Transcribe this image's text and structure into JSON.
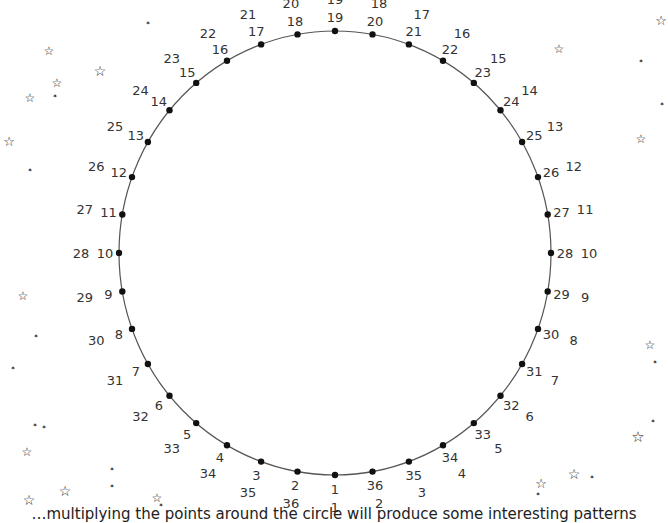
{
  "diagram": {
    "type": "modular-circle",
    "point_count": 36,
    "center": [
      335,
      253
    ],
    "radius_x": 216,
    "radius_y": 222,
    "start_point_position": "bottom",
    "direction": "clockwise-from-bottom",
    "line_color": "#555555",
    "dot_color": "#111111",
    "inner_labels": [
      1,
      2,
      3,
      4,
      5,
      6,
      7,
      8,
      9,
      10,
      11,
      12,
      13,
      14,
      15,
      16,
      17,
      18,
      19,
      20,
      21,
      22,
      23,
      24,
      25,
      26,
      27,
      28,
      29,
      30,
      31,
      32,
      33,
      34,
      35,
      36
    ],
    "outer_labels": [
      1,
      36,
      35,
      34,
      33,
      32,
      31,
      30,
      29,
      28,
      27,
      26,
      25,
      24,
      23,
      22,
      21,
      20,
      19,
      18,
      17,
      16,
      15,
      14,
      13,
      12,
      11,
      10,
      9,
      8,
      7,
      6,
      5,
      4,
      3,
      2
    ]
  },
  "stars": [
    {
      "x": 49,
      "y": 51,
      "size": 10
    },
    {
      "x": 57,
      "y": 83,
      "size": 10
    },
    {
      "x": 55,
      "y": 96,
      "size": 5
    },
    {
      "x": 30,
      "y": 98,
      "size": 10
    },
    {
      "x": 100,
      "y": 71,
      "size": 12
    },
    {
      "x": 148,
      "y": 23,
      "size": 5
    },
    {
      "x": 9,
      "y": 141,
      "size": 11
    },
    {
      "x": 30,
      "y": 170,
      "size": 5
    },
    {
      "x": 23,
      "y": 296,
      "size": 10
    },
    {
      "x": 36,
      "y": 336,
      "size": 5
    },
    {
      "x": 13,
      "y": 368,
      "size": 5
    },
    {
      "x": 35,
      "y": 425,
      "size": 5
    },
    {
      "x": 44,
      "y": 427,
      "size": 5
    },
    {
      "x": 27,
      "y": 452,
      "size": 10
    },
    {
      "x": 29,
      "y": 500,
      "size": 12
    },
    {
      "x": 65,
      "y": 491,
      "size": 12
    },
    {
      "x": 112,
      "y": 469,
      "size": 5
    },
    {
      "x": 112,
      "y": 486,
      "size": 5
    },
    {
      "x": 157,
      "y": 498,
      "size": 10
    },
    {
      "x": 161,
      "y": 505,
      "size": 5
    },
    {
      "x": 559,
      "y": 49,
      "size": 10
    },
    {
      "x": 661,
      "y": 20,
      "size": 11
    },
    {
      "x": 641,
      "y": 61,
      "size": 5
    },
    {
      "x": 662,
      "y": 104,
      "size": 5
    },
    {
      "x": 641,
      "y": 139,
      "size": 10
    },
    {
      "x": 650,
      "y": 345,
      "size": 10
    },
    {
      "x": 655,
      "y": 362,
      "size": 5
    },
    {
      "x": 653,
      "y": 421,
      "size": 5
    },
    {
      "x": 638,
      "y": 437,
      "size": 13
    },
    {
      "x": 574,
      "y": 474,
      "size": 12
    },
    {
      "x": 592,
      "y": 477,
      "size": 5
    },
    {
      "x": 541,
      "y": 483,
      "size": 11
    },
    {
      "x": 538,
      "y": 494,
      "size": 5
    }
  ],
  "caption": {
    "text": "…multiplying the points around the circle will produce some interesting patterns"
  }
}
